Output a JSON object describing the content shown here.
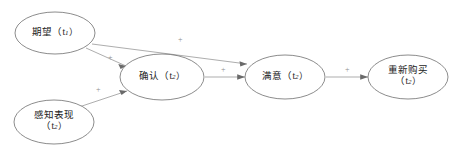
{
  "diagram": {
    "type": "path-diagram",
    "background_color": "#ffffff",
    "node_stroke_color": "#5a5a5a",
    "edge_color": "#8a8a8a",
    "label_color": "#1a1a1a",
    "edge_label_color": "#8e8e8e",
    "nodes": [
      {
        "id": "expectation",
        "name": "期望",
        "time": "t",
        "time_index": "1",
        "line1": "期望（t",
        "line1_sub": "1",
        "line1_end": "）",
        "cx": 55,
        "cy": 33,
        "rx": 40,
        "ry": 21
      },
      {
        "id": "perceived-performance",
        "name": "感知表现",
        "time": "t",
        "time_index": "2",
        "line1": "感知表现",
        "line2_open": "（t",
        "line2_sub": "2",
        "line2_end": "）",
        "cx": 54,
        "cy": 122,
        "rx": 40,
        "ry": 22
      },
      {
        "id": "confirmation",
        "name": "确认",
        "time": "t",
        "time_index": "2",
        "line1": "确认（t",
        "line1_sub": "2",
        "line1_end": "）",
        "cx": 162,
        "cy": 77,
        "rx": 42,
        "ry": 23
      },
      {
        "id": "satisfaction",
        "name": "满意",
        "time": "t",
        "time_index": "2",
        "line1": "满意（t",
        "line1_sub": "2",
        "line1_end": "）",
        "cx": 285,
        "cy": 77,
        "rx": 40,
        "ry": 22
      },
      {
        "id": "repurchase",
        "name": "重新购买",
        "time": "t",
        "time_index": "2",
        "line1": "重新购买",
        "line2_open": "（t",
        "line2_sub": "2",
        "line2_end": "）",
        "cx": 408,
        "cy": 77,
        "rx": 40,
        "ry": 22
      }
    ],
    "edges": [
      {
        "id": "expectation-to-satisfaction",
        "from": "期望",
        "to": "满意",
        "sign": "+",
        "label_x": 178,
        "label_y": 36
      },
      {
        "id": "expectation-to-confirmation",
        "from": "期望",
        "to": "确认",
        "sign": "+",
        "label_x": 108,
        "label_y": 54
      },
      {
        "id": "perceived-performance-to-confirmation",
        "from": "感知表现",
        "to": "确认",
        "sign": "+",
        "label_x": 96,
        "label_y": 86
      },
      {
        "id": "confirmation-to-satisfaction",
        "from": "确认",
        "to": "满意",
        "sign": "+",
        "label_x": 221,
        "label_y": 66
      },
      {
        "id": "satisfaction-to-repurchase",
        "from": "满意",
        "to": "重新购买",
        "sign": "+",
        "label_x": 345,
        "label_y": 66
      }
    ]
  }
}
